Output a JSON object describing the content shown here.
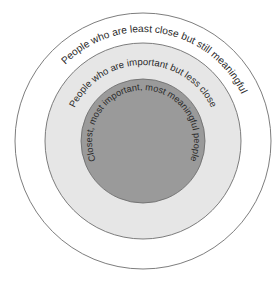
{
  "diagram": {
    "type": "concentric-circles",
    "center": [
      143,
      141
    ],
    "colors": {
      "background": "#ffffff",
      "outer_fill": "#ffffff",
      "middle_fill": "#e6e6e6",
      "inner_fill": "#9a9a9a",
      "stroke": "#6e6e6e",
      "text": "#2a2a2a"
    },
    "rings": [
      {
        "id": "outer",
        "radius": 128,
        "label": "People who are least close but still meaningful"
      },
      {
        "id": "middle",
        "radius": 98,
        "label": "People who are important but less close"
      },
      {
        "id": "inner",
        "radius": 62,
        "label": "Closest, most important, most meaningful people"
      }
    ]
  }
}
